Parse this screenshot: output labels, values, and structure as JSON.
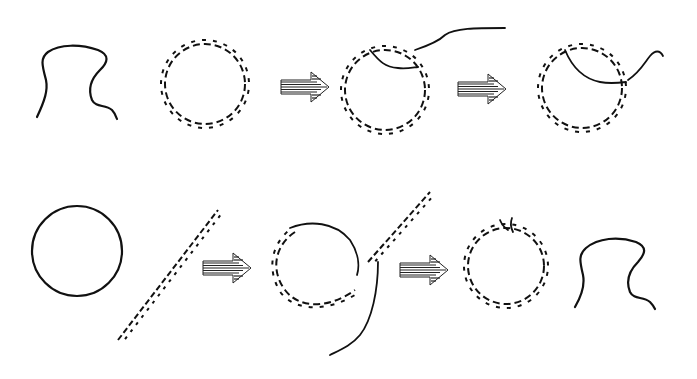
{
  "diagram": {
    "type": "molecular process schematic",
    "background": "#ffffff",
    "stroke_color": "#111111",
    "rows": [
      {
        "id": "top-row",
        "elements": [
          {
            "kind": "single-strand",
            "label": "single-stranded molecule (omega/hook shape)"
          },
          {
            "kind": "circular-dsDNA",
            "label": "circular double helix"
          },
          {
            "kind": "process-arrow",
            "icon": "striped-right-arrow"
          },
          {
            "kind": "circular-dsDNA-with-strand-invasion",
            "label": "strand invading circular duplex, tail extending right"
          },
          {
            "kind": "process-arrow",
            "icon": "striped-right-arrow"
          },
          {
            "kind": "circular-dsDNA-with-loop",
            "label": "strand incorporated into circle, short tail"
          }
        ]
      },
      {
        "id": "bottom-row",
        "elements": [
          {
            "kind": "circular-single-strand",
            "label": "single-stranded circle"
          },
          {
            "kind": "linear-dsDNA",
            "label": "linear double helix (diagonal)"
          },
          {
            "kind": "process-arrow",
            "icon": "striped-right-arrow"
          },
          {
            "kind": "partial-duplex-circle-with-linear-helix",
            "label": "circle partially paired, linear helix attached with free strand"
          },
          {
            "kind": "process-arrow",
            "icon": "striped-right-arrow"
          },
          {
            "kind": "circular-dsDNA-nicked",
            "label": "nicked circular double helix"
          },
          {
            "kind": "single-strand",
            "label": "released single strand (omega/hook shape)"
          }
        ]
      }
    ]
  }
}
